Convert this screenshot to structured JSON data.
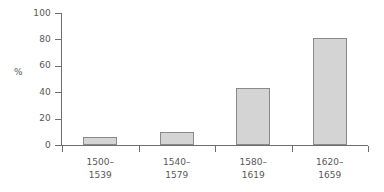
{
  "chart_data": {
    "type": "bar",
    "title": "",
    "subtitle": "",
    "xlabel": "",
    "ylabel": "%",
    "categories": [
      "1500–1539",
      "1540–1579",
      "1580–1619",
      "1620–1659"
    ],
    "category_lines": [
      [
        "1500–",
        "1539"
      ],
      [
        "1540–",
        "1579"
      ],
      [
        "1580–",
        "1619"
      ],
      [
        "1620–",
        "1659"
      ]
    ],
    "values": [
      6,
      10,
      43,
      81
    ],
    "ylim": [
      0,
      100
    ],
    "yticks": [
      0,
      20,
      40,
      60,
      80,
      100
    ],
    "ytick_labels": [
      "0",
      "20",
      "40",
      "60",
      "80",
      "100"
    ],
    "grid": false,
    "legend": null,
    "legend_position": "none",
    "annotations": [],
    "colors": {
      "bar_fill": "#d4d4d4",
      "bar_border": "#8a8a8a",
      "axis": "#6e6e6e",
      "text": "#585858",
      "background": "#ffffff"
    }
  }
}
